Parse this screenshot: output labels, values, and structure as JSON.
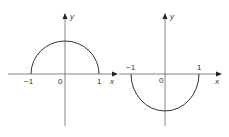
{
  "graphs": [
    {
      "name": "upper-semicircle",
      "description": "Upper semicircle y = sqrt(1 - x^2)",
      "axis_labels": {
        "x": "x",
        "y": "y"
      },
      "tick_labels": {
        "neg_one": "−1",
        "origin": "0",
        "one": "1"
      }
    },
    {
      "name": "lower-semicircle",
      "description": "Lower semicircle y = -sqrt(1 - x^2)",
      "axis_labels": {
        "x": "x",
        "y": "y"
      },
      "tick_labels": {
        "neg_one": "−1",
        "origin": "0",
        "one": "1"
      }
    }
  ],
  "colors": {
    "stroke": "#333333",
    "axis": "#555555"
  }
}
